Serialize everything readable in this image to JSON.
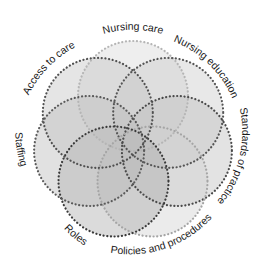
{
  "diagram": {
    "type": "seven-circle-venn",
    "center": [
      133,
      141
    ],
    "circle_radius": 55,
    "offset": 45,
    "circles": [
      {
        "label": "Nursing care",
        "angle": -90,
        "fill": "#d6d6d6",
        "stroke": "#b5b5b5"
      },
      {
        "label": "Nursing education",
        "angle": -38.6,
        "fill": "#c8c8c8",
        "stroke": "#555555"
      },
      {
        "label": "Standards of practice",
        "angle": 12.9,
        "fill": "#bdbdbd",
        "stroke": "#4a4a4a"
      },
      {
        "label": "Policies and procedures",
        "angle": 64.3,
        "fill": "#d0d0d0",
        "stroke": "#a5a5a5"
      },
      {
        "label": "Roles",
        "angle": 115.7,
        "fill": "#aaaaaa",
        "stroke": "#3a3a3a"
      },
      {
        "label": "Staffing",
        "angle": 167.1,
        "fill": "#b8b8b8",
        "stroke": "#5a5a5a"
      },
      {
        "label": "Access to care",
        "angle": 218.6,
        "fill": "#c2c2c2",
        "stroke": "#505050"
      }
    ],
    "labels": [
      {
        "text": "Nursing care"
      },
      {
        "text": "Nursing education"
      },
      {
        "text": "Standards of practice"
      },
      {
        "text": "Policies and procedures"
      },
      {
        "text": "Roles"
      },
      {
        "text": "Staffing"
      },
      {
        "text": "Access to care"
      }
    ]
  }
}
